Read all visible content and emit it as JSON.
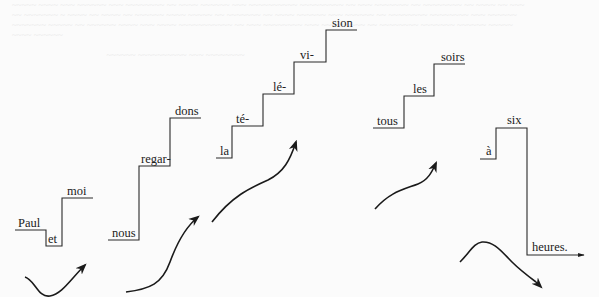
{
  "figure": {
    "type": "intonation-staircase-diagram",
    "language": "French",
    "background_showthrough": "faint illegible text from reverse side of page",
    "colors": {
      "ink": "#222222",
      "paper": "#fbfbfb",
      "showthrough": "#e9e9e9"
    }
  },
  "phrases": [
    {
      "id": "paul-et-moi",
      "syllables": [
        "Paul",
        "et",
        "moi"
      ],
      "contour_arrow": "falls then rises"
    },
    {
      "id": "nous-regardons",
      "syllables": [
        "nous",
        "regar-",
        "dons"
      ],
      "contour_arrow": "rising"
    },
    {
      "id": "la-television",
      "syllables": [
        "la",
        "té-",
        "lé-",
        "vi-",
        "sion"
      ],
      "contour_arrow": "rising"
    },
    {
      "id": "tous-les-soirs",
      "syllables": [
        "tous",
        "les",
        "soirs"
      ],
      "contour_arrow": "rising"
    },
    {
      "id": "a-six-heures",
      "syllables": [
        "à",
        "six",
        "heures."
      ],
      "contour_arrow": "rises then falls"
    }
  ]
}
